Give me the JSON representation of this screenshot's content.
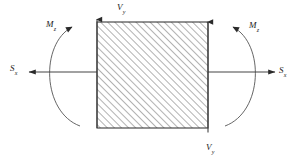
{
  "figure": {
    "type": "free-body-diagram",
    "background_color": "#ffffff",
    "line_color": "#3a3a3a",
    "hatch_color": "#555555",
    "text_color": "#1a1a1a"
  },
  "labels": {
    "shear_top": {
      "symbol": "V",
      "subscript": "y"
    },
    "shear_bottom": {
      "symbol": "V",
      "subscript": "y"
    },
    "moment_left": {
      "symbol": "M",
      "subscript": "z"
    },
    "moment_right": {
      "symbol": "M",
      "subscript": "z"
    },
    "force_left": {
      "symbol": "S",
      "subscript": "x"
    },
    "force_right": {
      "symbol": "S",
      "subscript": "x"
    }
  },
  "geometry": {
    "section": {
      "x": 97,
      "y": 22,
      "width": 111,
      "height": 106
    },
    "hatch_angle_deg": 45,
    "hatch_spacing_px": 5
  },
  "arrows": {
    "vertical_left": {
      "direction": "up",
      "x": 97,
      "from_y": 128,
      "to_y": 18
    },
    "vertical_right": {
      "direction": "down",
      "x": 208,
      "from_y": 22,
      "to_y": 134
    },
    "horizontal_left": {
      "direction": "left",
      "y": 72,
      "from_x": 97,
      "to_x": 27
    },
    "horizontal_right": {
      "direction": "right",
      "y": 72,
      "from_x": 208,
      "to_x": 277
    },
    "moment_left": {
      "sense": "clockwise-open-right",
      "arrowhead": "top-right"
    },
    "moment_right": {
      "sense": "counterclockwise-open-left",
      "arrowhead": "top-left"
    }
  }
}
